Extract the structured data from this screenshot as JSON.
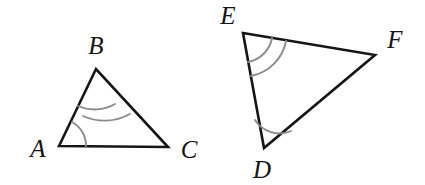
{
  "figure": {
    "background_color": "#ffffff",
    "edge_color": "#151515",
    "arc_color": "#8c8c8c",
    "label_color": "#141414",
    "width": 425,
    "height": 185
  },
  "triangles": [
    {
      "name": "triangle-abc",
      "vertices": [
        {
          "label": "A",
          "x": 59,
          "y": 146,
          "label_x": 38,
          "label_y": 157,
          "arc_count": 1
        },
        {
          "label": "B",
          "x": 96,
          "y": 69,
          "label_x": 96,
          "label_y": 54,
          "arc_count": 2
        },
        {
          "label": "C",
          "x": 168,
          "y": 147,
          "label_x": 189,
          "label_y": 158,
          "arc_count": 0
        }
      ],
      "path": "M 59 146 L 96 69 L 168 147 Z",
      "arcs": [
        {
          "vertex": "A",
          "d": "M 86 146 A 27 27 0 0 0 72 122",
          "marks": 1
        },
        {
          "vertex": "B",
          "d": "M 78 106 A 41 41 0 0 0 115 104",
          "marks": 2
        },
        {
          "vertex": "B",
          "d": "M 83 116 A 52 52 0 0 0 130 114",
          "marks": 2
        }
      ]
    },
    {
      "name": "triangle-def",
      "vertices": [
        {
          "label": "D",
          "x": 264,
          "y": 148,
          "label_x": 262,
          "label_y": 178,
          "arc_count": 1
        },
        {
          "label": "E",
          "x": 243,
          "y": 33,
          "label_x": 228,
          "label_y": 24,
          "arc_count": 2
        },
        {
          "label": "F",
          "x": 375,
          "y": 55,
          "label_x": 395,
          "label_y": 48,
          "arc_count": 0
        }
      ],
      "path": "M 243 33 L 375 55 L 264 148 Z",
      "arcs": [
        {
          "vertex": "D",
          "d": "M 255 120 A 29 29 0 0 0 291 131",
          "marks": 1
        },
        {
          "vertex": "E",
          "d": "M 248 62 A 30 30 0 0 0 272 38",
          "marks": 2
        },
        {
          "vertex": "E",
          "d": "M 251 76 A 44 44 0 0 0 286 41",
          "marks": 2
        }
      ]
    }
  ],
  "labels": {
    "a": "A",
    "b": "B",
    "c": "C",
    "d": "D",
    "e": "E",
    "f": "F"
  }
}
